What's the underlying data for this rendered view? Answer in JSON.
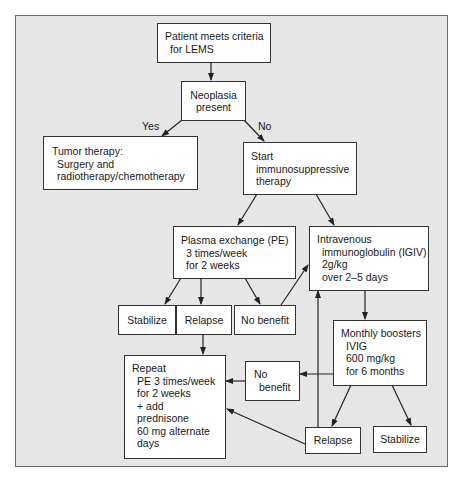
{
  "diagram": {
    "type": "flowchart",
    "nodes": {
      "start": {
        "lines": [
          "Patient meets criteria",
          "for LEMS"
        ]
      },
      "neoplasia": {
        "lines": [
          "Neoplasia",
          "present"
        ]
      },
      "tumor": {
        "lines": [
          "Tumor therapy:",
          "Surgery and",
          "radiotherapy/chemotherapy"
        ]
      },
      "immuno": {
        "lines": [
          "Start",
          "immunosuppressive",
          "therapy"
        ]
      },
      "pe": {
        "lines": [
          "Plasma exchange (PE)",
          "3 times/week",
          "for 2 weeks"
        ]
      },
      "igiv": {
        "lines": [
          "Intravenous",
          "immunoglobulin (IGIV)",
          "2g/kg",
          "over 2–5 days"
        ]
      },
      "stabilize1": {
        "lines": [
          "Stabilize"
        ]
      },
      "relapse1": {
        "lines": [
          "Relapse"
        ]
      },
      "nobenefit1": {
        "lines": [
          "No benefit"
        ]
      },
      "boosters": {
        "lines": [
          "Monthly boosters",
          "IVIG",
          "600 mg/kg",
          "for 6 months"
        ]
      },
      "repeat": {
        "lines": [
          "Repeat",
          "PE 3 times/week",
          "for 2 weeks",
          "+ add",
          "prednisone",
          "60 mg alternate",
          "days"
        ]
      },
      "nobenefit2": {
        "lines": [
          "No",
          "benefit"
        ]
      },
      "relapse2": {
        "lines": [
          "Relapse"
        ]
      },
      "stabilize2": {
        "lines": [
          "Stabilize"
        ]
      }
    },
    "edge_labels": {
      "yes": "Yes",
      "no": "No"
    },
    "edges": [
      [
        "start",
        "neoplasia"
      ],
      [
        "neoplasia",
        "tumor",
        "Yes"
      ],
      [
        "neoplasia",
        "immuno",
        "No"
      ],
      [
        "immuno",
        "pe"
      ],
      [
        "immuno",
        "igiv"
      ],
      [
        "pe",
        "stabilize1"
      ],
      [
        "pe",
        "relapse1"
      ],
      [
        "pe",
        "nobenefit1"
      ],
      [
        "nobenefit1",
        "igiv"
      ],
      [
        "relapse1",
        "repeat"
      ],
      [
        "igiv",
        "boosters"
      ],
      [
        "boosters",
        "nobenefit2"
      ],
      [
        "nobenefit2",
        "repeat"
      ],
      [
        "boosters",
        "relapse2"
      ],
      [
        "boosters",
        "stabilize2"
      ],
      [
        "relapse2",
        "repeat"
      ],
      [
        "relapse2",
        "igiv"
      ]
    ]
  },
  "colors": {
    "frame_bg": "#e6e6e6",
    "box_bg": "#ffffff",
    "stroke": "#333333"
  }
}
